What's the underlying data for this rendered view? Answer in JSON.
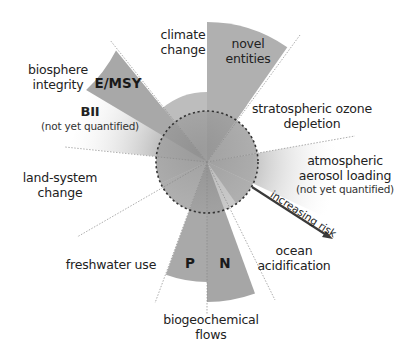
{
  "diagram": {
    "type": "planetary-boundaries-radial",
    "center": {
      "x": 207,
      "y": 162
    },
    "safe_boundary_radius": 51,
    "colors": {
      "sector_dark": "#9a9a9a",
      "sector_mid": "#b3b3b3",
      "sector_light": "#c9c9c9",
      "globe": "#8e8e8e",
      "dashed_circle": "#333333",
      "arrow": "#3a3a3a",
      "text": "#222222"
    },
    "boundaries": [
      {
        "id": "climate-change",
        "label": "climate change",
        "status": "increasing risk"
      },
      {
        "id": "novel-entities",
        "label": "novel entities",
        "status": "beyond boundary"
      },
      {
        "id": "stratospheric-ozone",
        "label": "stratospheric ozone depletion",
        "status": "safe"
      },
      {
        "id": "aerosol",
        "label": "atmospheric aerosol loading",
        "note": "(not yet quantified)"
      },
      {
        "id": "ocean",
        "label": "ocean acidification",
        "status": "safe"
      },
      {
        "id": "biogeochemical",
        "label": "biogeochemical flows",
        "sub_sectors": [
          "P",
          "N"
        ]
      },
      {
        "id": "freshwater",
        "label": "freshwater use",
        "status": "safe"
      },
      {
        "id": "land-system",
        "label": "land-system change",
        "status": "increasing risk"
      },
      {
        "id": "biosphere",
        "label": "biosphere integrity",
        "sub_sectors": [
          "E/MSY",
          "BII"
        ]
      }
    ]
  },
  "labels": {
    "climate": [
      "climate",
      "change"
    ],
    "novel": [
      "novel",
      "entities"
    ],
    "ozone": [
      "stratospheric ozone",
      "depletion"
    ],
    "aerosol": [
      "atmospheric",
      "aerosol loading"
    ],
    "aerosol_note": "(not yet quantified)",
    "ocean": [
      "ocean",
      "acidification"
    ],
    "biogeo": [
      "biogeochemical",
      "flows"
    ],
    "freshwater": "freshwater use",
    "land": [
      "land-system",
      "change"
    ],
    "biosphere": [
      "biosphere",
      "integrity"
    ],
    "emsy": "E/MSY",
    "bii": "BII",
    "bii_note": "(not yet quantified)",
    "p": "P",
    "n": "N",
    "risk_arrow": "increasing risk"
  }
}
